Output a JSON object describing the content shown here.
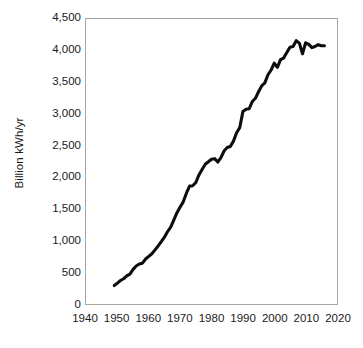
{
  "chart_data": {
    "type": "line",
    "title": "",
    "xlabel": "",
    "ylabel": "Billion kWh/yr",
    "xlim": [
      1940,
      2020
    ],
    "ylim": [
      0,
      4500
    ],
    "grid": false,
    "legend": null,
    "line_color": "#0d0d0d",
    "frame_color": "#a6a6a6",
    "xticks": [
      1940,
      1950,
      1960,
      1970,
      1980,
      1990,
      2000,
      2010,
      2020
    ],
    "xtick_labels": [
      "1940",
      "1950",
      "1960",
      "1970",
      "1980",
      "1990",
      "2000",
      "2010",
      "2020"
    ],
    "yticks": [
      0,
      500,
      1000,
      1500,
      2000,
      2500,
      3000,
      3500,
      4000,
      4500
    ],
    "ytick_labels": [
      "0",
      "500",
      "1,000",
      "1,500",
      "2,000",
      "2,500",
      "3,000",
      "3,500",
      "4,000",
      "4,500"
    ],
    "series": [
      {
        "name": "Electricity generation",
        "x": [
          1949,
          1950,
          1951,
          1952,
          1953,
          1954,
          1955,
          1956,
          1957,
          1958,
          1959,
          1960,
          1961,
          1962,
          1963,
          1964,
          1965,
          1966,
          1967,
          1968,
          1969,
          1970,
          1971,
          1972,
          1973,
          1974,
          1975,
          1976,
          1977,
          1978,
          1979,
          1980,
          1981,
          1982,
          1983,
          1984,
          1985,
          1986,
          1987,
          1988,
          1989,
          1990,
          1991,
          1992,
          1993,
          1994,
          1995,
          1996,
          1997,
          1998,
          1999,
          2000,
          2001,
          2002,
          2003,
          2004,
          2005,
          2006,
          2007,
          2008,
          2009,
          2010,
          2011,
          2012,
          2013,
          2014,
          2015,
          2016
        ],
        "y": [
          291,
          329,
          371,
          399,
          443,
          472,
          547,
          601,
          632,
          645,
          710,
          753,
          794,
          855,
          917,
          984,
          1055,
          1144,
          1214,
          1329,
          1442,
          1532,
          1613,
          1750,
          1861,
          1867,
          1918,
          2038,
          2124,
          2206,
          2247,
          2286,
          2295,
          2241,
          2310,
          2416,
          2470,
          2487,
          2572,
          2704,
          2784,
          3038,
          3074,
          3083,
          3197,
          3248,
          3353,
          3444,
          3492,
          3620,
          3695,
          3802,
          3737,
          3858,
          3883,
          3971,
          4055,
          4065,
          4157,
          4119,
          3950,
          4125,
          4100,
          4048,
          4066,
          4094,
          4078,
          4077
        ]
      }
    ],
    "annotations": []
  },
  "axes": {
    "y_title": "Billion kWh/yr"
  },
  "caption": {
    "sliver_text": ""
  }
}
